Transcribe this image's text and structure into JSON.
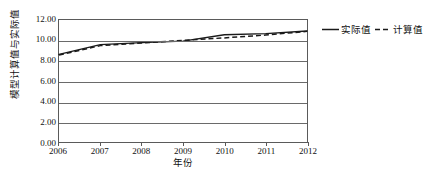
{
  "chart_data": {
    "type": "line",
    "title": "",
    "xlabel": "年份",
    "ylabel": "模型计算值与实际值",
    "x": [
      2006,
      2007,
      2008,
      2009,
      2010,
      2011,
      2012
    ],
    "xticklabels": [
      "2006",
      "2007",
      "2008",
      "2009",
      "2010",
      "2011",
      "2012"
    ],
    "yticklabels": [
      "0.00",
      "2.00",
      "4.00",
      "6.00",
      "8.00",
      "10.00",
      "12.00"
    ],
    "yticks": [
      0,
      2,
      4,
      6,
      8,
      10,
      12
    ],
    "ylim": [
      0,
      12
    ],
    "xlim": [
      2006,
      2012
    ],
    "grid": "horizontal",
    "legend_position": "right",
    "series": [
      {
        "name": "实际值",
        "style": "solid",
        "color": "#1a1a1a",
        "values": [
          8.62,
          9.58,
          9.78,
          9.92,
          10.55,
          10.66,
          10.92
        ]
      },
      {
        "name": "计算值",
        "style": "dashed",
        "color": "#1a1a1a",
        "values": [
          8.55,
          9.48,
          9.74,
          10.0,
          10.24,
          10.52,
          10.88
        ]
      }
    ]
  },
  "legend": {
    "items": [
      {
        "label": "实际值",
        "style": "solid"
      },
      {
        "label": "计算值",
        "style": "dashed"
      }
    ]
  }
}
